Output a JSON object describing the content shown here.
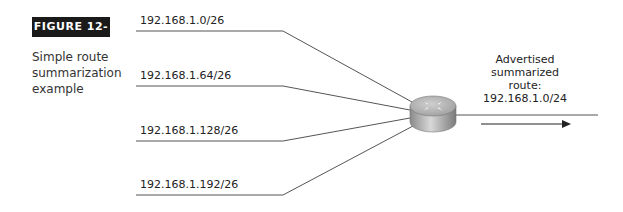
{
  "figure": {
    "badge": "FIGURE 12-6",
    "caption": "Simple route summarization example"
  },
  "subnets": [
    {
      "label": "192.168.1.0/26"
    },
    {
      "label": "192.168.1.64/26"
    },
    {
      "label": "192.168.1.128/26"
    },
    {
      "label": "192.168.1.192/26"
    }
  ],
  "router": {
    "icon": "router-icon"
  },
  "advertised": {
    "line1": "Advertised",
    "line2": "summarized",
    "line3": "route:",
    "line4": "192.168.1.0/24"
  },
  "colors": {
    "line": "#555555",
    "badge_bg": "#1a1a1a",
    "router_body": "#b8b8b8"
  }
}
